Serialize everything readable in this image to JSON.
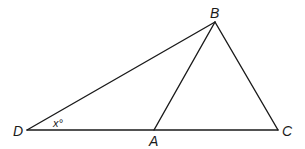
{
  "diagram": {
    "type": "triangle-geometry",
    "points": {
      "D": {
        "x": 27,
        "y": 130
      },
      "A": {
        "x": 154,
        "y": 130
      },
      "C": {
        "x": 278,
        "y": 130
      },
      "B": {
        "x": 215,
        "y": 22
      }
    },
    "segments": [
      {
        "from": "D",
        "to": "C",
        "name": "segment-DC"
      },
      {
        "from": "D",
        "to": "B",
        "name": "segment-DB"
      },
      {
        "from": "A",
        "to": "B",
        "name": "segment-AB"
      },
      {
        "from": "B",
        "to": "C",
        "name": "segment-BC"
      }
    ],
    "labels": {
      "B": "B",
      "D": "D",
      "A": "A",
      "C": "C"
    },
    "angle_label": {
      "vertex": "D",
      "text": "x°"
    },
    "stroke_color": "#1a1a1a",
    "background_color": "#ffffff"
  }
}
